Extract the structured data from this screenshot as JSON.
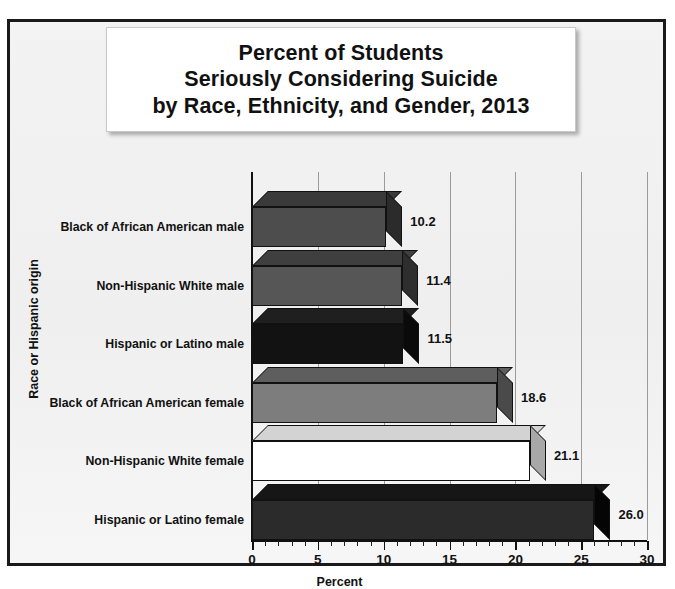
{
  "chart_data": {
    "type": "bar",
    "orientation": "horizontal",
    "title_lines": [
      "Percent of Students",
      "Seriously Considering Suicide",
      "by Race, Ethnicity, and Gender, 2013"
    ],
    "title": "Percent of Students Seriously Considering Suicide by Race, Ethnicity, and Gender, 2013",
    "xlabel": "Percent",
    "ylabel": "Race or Hispanic origin",
    "xlim": [
      0,
      30
    ],
    "xticks": [
      0,
      5,
      10,
      15,
      20,
      25,
      30
    ],
    "xtick_labels": [
      "0",
      "5",
      "10",
      "15",
      "20",
      "25",
      "30"
    ],
    "minor_tick_step": 1,
    "grid": "vertical-major",
    "legend": "none",
    "categories": [
      "Hispanic or Latino female",
      "Non-Hispanic White female",
      "Black of African American female",
      "Hispanic or Latino male",
      "Non-Hispanic White male",
      "Black of African American male"
    ],
    "values": [
      26.0,
      21.1,
      18.6,
      11.5,
      11.4,
      10.2
    ],
    "data_labels": [
      "26.0",
      "21.1",
      "18.6",
      "11.5",
      "11.4",
      "10.2"
    ],
    "bars": [
      {
        "category": "Black of African American male",
        "value": 10.2,
        "label": "10.2",
        "face": "#4d4d4d",
        "top": "#3a3a3a",
        "side": "#2b2b2b"
      },
      {
        "category": "Non-Hispanic White male",
        "value": 11.4,
        "label": "11.4",
        "face": "#565656",
        "top": "#3f3f3f",
        "side": "#2e2e2e"
      },
      {
        "category": "Hispanic or Latino male",
        "value": 11.5,
        "label": "11.5",
        "face": "#121212",
        "top": "#1f1f1f",
        "side": "#0a0a0a"
      },
      {
        "category": "Black of African American female",
        "value": 18.6,
        "label": "18.6",
        "face": "#7d7d7d",
        "top": "#5e5e5e",
        "side": "#4a4a4a"
      },
      {
        "category": "Non-Hispanic White female",
        "value": 21.1,
        "label": "21.1",
        "face": "#ffffff",
        "top": "#d3d3d3",
        "side": "#a8a8a8"
      },
      {
        "category": "Hispanic or Latino female",
        "value": 26.0,
        "label": "26.0",
        "face": "#2b2b2b",
        "top": "#161616",
        "side": "#050505"
      }
    ],
    "colors": {
      "page_background": "#ffffff",
      "card_background": "#f2f2f2",
      "card_border": "#1a1a1a",
      "title_panel": "#ffffff",
      "gridline": "#9b9b9b",
      "axis": "#111111",
      "text": "#111111"
    }
  }
}
